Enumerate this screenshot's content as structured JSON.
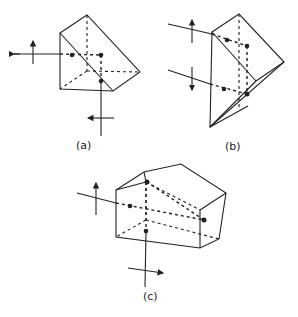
{
  "figures": [
    {
      "id": "a",
      "label": "(a)"
    },
    {
      "id": "b",
      "label": "(b)"
    },
    {
      "id": "c",
      "label": "(c)"
    }
  ],
  "colors": {
    "line": "#222222",
    "background": "#ffffff"
  }
}
